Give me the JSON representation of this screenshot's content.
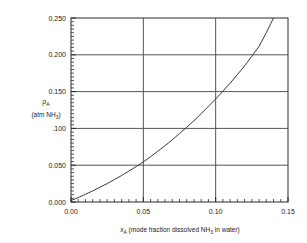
{
  "chart_data": {
    "type": "line",
    "title": "",
    "subtitle": "",
    "xlabel_parts": {
      "symbol": "x",
      "symbol_sub": "A",
      "rest": " (mode fraction dissolved NH",
      "rest_sub": "3",
      "tail": " in water)"
    },
    "xlabel": "xA (mode fraction dissolved NH3 in water)",
    "ylabel_parts": {
      "symbol": "p",
      "symbol_sub": "A",
      "units_open": "(atm NH",
      "units_sub": "3",
      "units_close": ")"
    },
    "ylabel": "pA (atm NH3)",
    "xlim": [
      0.0,
      0.15
    ],
    "ylim": [
      0.0,
      0.25
    ],
    "xticks": [
      0.0,
      0.05,
      0.1,
      0.15
    ],
    "xtick_labels": [
      "0.00",
      "0.05",
      "0.10",
      "0.15"
    ],
    "yticks": [
      0.0,
      0.05,
      0.1,
      0.15,
      0.2,
      0.25
    ],
    "ytick_labels": [
      "0.000",
      "0.050",
      ".100",
      "0.150",
      "0.200",
      "0.250"
    ],
    "grid": true,
    "grid_x_values": [
      0.05,
      0.1
    ],
    "grid_y_values": [
      0.05,
      0.1,
      0.15,
      0.2
    ],
    "legend": "none",
    "x_minor_ticks_per_major": 10,
    "y_minor_ticks_per_major": 10,
    "series": [
      {
        "name": "equilibrium curve",
        "color": "#3a3a3a",
        "x": [
          0.0,
          0.005,
          0.01,
          0.015,
          0.02,
          0.025,
          0.03,
          0.035,
          0.04,
          0.045,
          0.05,
          0.055,
          0.06,
          0.065,
          0.07,
          0.075,
          0.08,
          0.085,
          0.09,
          0.095,
          0.1,
          0.105,
          0.11,
          0.115,
          0.12,
          0.125,
          0.13,
          0.135,
          0.14
        ],
        "y": [
          0.002,
          0.006,
          0.0105,
          0.015,
          0.02,
          0.025,
          0.0305,
          0.036,
          0.042,
          0.048,
          0.0545,
          0.0615,
          0.069,
          0.0765,
          0.0845,
          0.093,
          0.1015,
          0.1105,
          0.12,
          0.13,
          0.14,
          0.1505,
          0.1615,
          0.173,
          0.185,
          0.198,
          0.2115,
          0.23,
          0.25
        ]
      }
    ]
  },
  "colors": {
    "frame": "#2b2b2b",
    "grid": "#555555",
    "curve": "#3a3a3a",
    "text": "#1a1a1a",
    "background": "#ffffff"
  }
}
